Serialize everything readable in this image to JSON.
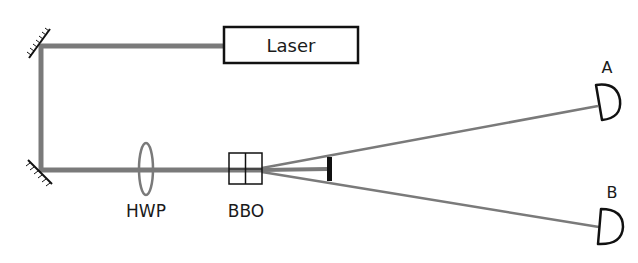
{
  "diagram": {
    "type": "optical-setup",
    "components": {
      "laser": {
        "label": "Laser"
      },
      "hwp": {
        "label": "HWP"
      },
      "bbo": {
        "label": "BBO"
      },
      "detector_a": {
        "label": "A"
      },
      "detector_b": {
        "label": "B"
      }
    },
    "colors": {
      "beam": "#7a7a7a",
      "outline": "#111111",
      "background": "#ffffff"
    }
  }
}
